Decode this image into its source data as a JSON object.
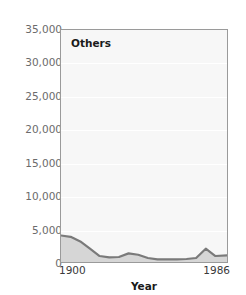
{
  "colors": {
    "page_background": "#ffffff",
    "plot_background": "#f7f7f7",
    "plot_border": "#9a9a9a",
    "gridline": "#ffffff",
    "series_line": "#7a7a7a",
    "series_fill": "#d6d6d6",
    "tick_label": "#6b6b6b",
    "axis_label": "#1a1a1a"
  },
  "chart_data": {
    "type": "area",
    "title": "Others",
    "subtitle": "",
    "xlabel": "Year",
    "ylabel": "",
    "grid": true,
    "legend_position": "none",
    "annotations": [
      "Others"
    ],
    "xlim": [
      1900,
      1986
    ],
    "ylim": [
      0,
      35000
    ],
    "xtick_labels": [
      "1900",
      "1986"
    ],
    "xticks": [
      1900,
      1986
    ],
    "ytick_labels": [
      "0",
      "5,000",
      "10,000",
      "15,000",
      "20,000",
      "25,000",
      "30,000",
      "35,000"
    ],
    "yticks": [
      0,
      5000,
      10000,
      15000,
      20000,
      25000,
      30000,
      35000
    ],
    "series": [
      {
        "name": "Others",
        "x": [
          1900,
          1905,
          1910,
          1915,
          1920,
          1925,
          1930,
          1935,
          1940,
          1945,
          1950,
          1955,
          1960,
          1965,
          1970,
          1975,
          1980,
          1986
        ],
        "values": [
          4000,
          3800,
          3100,
          2000,
          900,
          700,
          750,
          1300,
          1100,
          600,
          400,
          400,
          400,
          450,
          600,
          2000,
          900,
          1000
        ]
      }
    ]
  },
  "axis": {
    "y_labels": [
      "35,000",
      "30,000",
      "25,000",
      "20,000",
      "15,000",
      "10,000",
      "5,000",
      "0"
    ],
    "x_start_label": "1900",
    "x_end_label": "1986",
    "x_title": "Year"
  },
  "plot": {
    "series_label": "Others"
  }
}
